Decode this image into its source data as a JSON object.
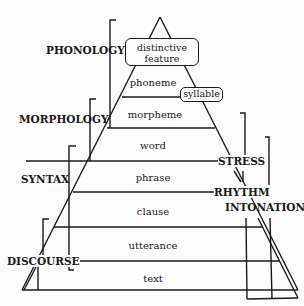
{
  "diagram": {
    "type": "pyramid",
    "levels": [
      {
        "label": "distinctive feature",
        "boxed": true
      },
      {
        "label": "phoneme"
      },
      {
        "label": "morpheme"
      },
      {
        "label": "word"
      },
      {
        "label": "phrase"
      },
      {
        "label": "clause"
      },
      {
        "label": "utterance"
      },
      {
        "label": "text"
      }
    ],
    "feature_box": {
      "line1": "distinctive",
      "line2": "feature"
    },
    "syllable_box": "syllable",
    "left_domains": [
      {
        "label": "PHONOLOGY"
      },
      {
        "label": "MORPHOLOGY"
      },
      {
        "label": "SYNTAX"
      },
      {
        "label": "DISCOURSE"
      }
    ],
    "right_domains": [
      {
        "label": "STRESS"
      },
      {
        "label": "RHYTHM"
      },
      {
        "label": "INTONATION"
      }
    ],
    "line_color": "#1a1a1a"
  }
}
